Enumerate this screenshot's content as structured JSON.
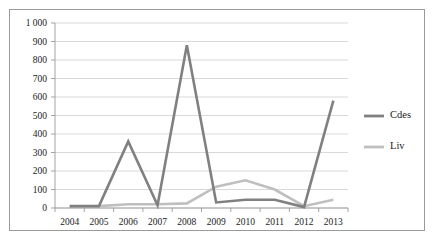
{
  "chart_data": {
    "type": "line",
    "title": "",
    "xlabel": "",
    "ylabel": "",
    "categories": [
      "2004",
      "2005",
      "2006",
      "2007",
      "2008",
      "2009",
      "2010",
      "2011",
      "2012",
      "2013"
    ],
    "ylim": [
      0,
      1000
    ],
    "y_ticks": [
      0,
      100,
      200,
      300,
      400,
      500,
      600,
      700,
      800,
      900,
      1000
    ],
    "y_tick_labels": [
      "0",
      "100",
      "200",
      "300",
      "400",
      "500",
      "600",
      "700",
      "800",
      "900",
      "1 000"
    ],
    "grid": true,
    "legend_position": "right",
    "series": [
      {
        "name": "Cdes",
        "color": "#808080",
        "values": [
          10,
          10,
          360,
          15,
          880,
          30,
          45,
          45,
          5,
          580
        ]
      },
      {
        "name": "Liv",
        "color": "#bfbfbf",
        "values": [
          5,
          10,
          20,
          20,
          25,
          115,
          150,
          100,
          10,
          45
        ]
      }
    ]
  },
  "legend": {
    "entries": [
      {
        "label": "Cdes",
        "color": "#808080"
      },
      {
        "label": "Liv",
        "color": "#bfbfbf"
      }
    ]
  },
  "colors": {
    "cdes": "#808080",
    "liv": "#bfbfbf",
    "grid": "#c8c8c8",
    "axis": "#9a9a9a",
    "frame": "#9a9a9a",
    "text": "#1a1a1a",
    "background": "#ffffff"
  }
}
